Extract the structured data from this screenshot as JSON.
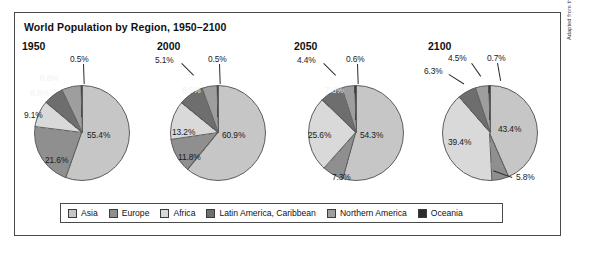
{
  "figure": {
    "title": "World Population by Region, 1950–2100",
    "credit": "Adapted from the United Nations Population Division."
  },
  "legend": {
    "items": [
      {
        "label": "Asia",
        "color": "#c6c6c6"
      },
      {
        "label": "Europe",
        "color": "#8f8f8f"
      },
      {
        "label": "Africa",
        "color": "#d9d9d9"
      },
      {
        "label": "Latin America, Caribbean",
        "color": "#6e6e6e"
      },
      {
        "label": "Northern America",
        "color": "#9e9e9e"
      },
      {
        "label": "Oceania",
        "color": "#2b2b2b"
      }
    ]
  },
  "chart_data": {
    "type": "pie",
    "title": "World Population by Region, 1950–2100",
    "xlabel": "",
    "ylabel": "",
    "legend_position": "bottom",
    "unit": "percent",
    "categories": [
      "Asia",
      "Europe",
      "Africa",
      "Latin America, Caribbean",
      "Northern America",
      "Oceania"
    ],
    "colors": [
      "#c6c6c6",
      "#8f8f8f",
      "#d9d9d9",
      "#6e6e6e",
      "#9e9e9e",
      "#2b2b2b"
    ],
    "panels": [
      {
        "year": "1950",
        "values": [
          55.4,
          21.6,
          9.1,
          6.8,
          6.6,
          0.5
        ],
        "labels": [
          "55.4%",
          "21.6%",
          "9.1%",
          "6.8%",
          "6.6%",
          "0.5%"
        ]
      },
      {
        "year": "2000",
        "values": [
          60.9,
          11.8,
          13.2,
          8.5,
          5.1,
          0.5
        ],
        "labels": [
          "60.9%",
          "11.8%",
          "13.2%",
          "8.5%",
          "5.1%",
          "0.5%"
        ]
      },
      {
        "year": "2050",
        "values": [
          54.3,
          7.3,
          25.6,
          7.8,
          4.4,
          0.6
        ],
        "labels": [
          "54.3%",
          "7.3%",
          "25.6%",
          "7.8%",
          "4.4%",
          "0.6%"
        ]
      },
      {
        "year": "2100",
        "values": [
          43.4,
          5.8,
          39.4,
          6.3,
          4.5,
          0.7
        ],
        "labels": [
          "43.4%",
          "5.8%",
          "39.4%",
          "6.3%",
          "4.5%",
          "0.7%"
        ]
      }
    ]
  },
  "panels": [
    {
      "year": "1950",
      "year_x": 22,
      "year_y": 40,
      "cx": 82,
      "cy": 133,
      "r": 48,
      "labels": [
        {
          "text": "55.4%",
          "x": 87,
          "y": 130,
          "style": "inner-dark"
        },
        {
          "text": "21.6%",
          "x": 45,
          "y": 155,
          "style": "inner-dark"
        },
        {
          "text": "9.1%",
          "x": 24,
          "y": 110,
          "style": "inner-dark"
        },
        {
          "text": "6.8%",
          "x": 30,
          "y": 88,
          "style": "inner-light"
        },
        {
          "text": "6.6%",
          "x": 40,
          "y": 73,
          "style": "inner-light"
        },
        {
          "text": "0.5%",
          "x": 70,
          "y": 54,
          "style": "inner-dark"
        }
      ],
      "leaders": [
        {
          "x": 84,
          "y": 64,
          "len": 20,
          "rot": 88
        }
      ]
    },
    {
      "year": "2000",
      "year_x": 157,
      "year_y": 40,
      "cx": 218,
      "cy": 133,
      "r": 48,
      "labels": [
        {
          "text": "60.9%",
          "x": 222,
          "y": 130,
          "style": "inner-dark"
        },
        {
          "text": "11.8%",
          "x": 178,
          "y": 152,
          "style": "inner-dark"
        },
        {
          "text": "13.2%",
          "x": 172,
          "y": 127,
          "style": "inner-dark"
        },
        {
          "text": "8.5%",
          "x": 182,
          "y": 85,
          "style": "inner-light"
        },
        {
          "text": "5.1%",
          "x": 155,
          "y": 55,
          "style": "inner-dark"
        },
        {
          "text": "0.5%",
          "x": 208,
          "y": 54,
          "style": "inner-dark"
        }
      ],
      "leaders": [
        {
          "x": 182,
          "y": 63,
          "len": 17,
          "rot": 45
        },
        {
          "x": 220,
          "y": 64,
          "len": 20,
          "rot": 88
        }
      ]
    },
    {
      "year": "2050",
      "year_x": 294,
      "year_y": 40,
      "cx": 356,
      "cy": 133,
      "r": 48,
      "labels": [
        {
          "text": "54.3%",
          "x": 360,
          "y": 130,
          "style": "inner-dark"
        },
        {
          "text": "7.3%",
          "x": 332,
          "y": 172,
          "style": "inner-dark"
        },
        {
          "text": "25.6%",
          "x": 308,
          "y": 130,
          "style": "inner-dark"
        },
        {
          "text": "7.8%",
          "x": 325,
          "y": 85,
          "style": "inner-light"
        },
        {
          "text": "4.4%",
          "x": 297,
          "y": 55,
          "style": "inner-dark"
        },
        {
          "text": "0.6%",
          "x": 346,
          "y": 54,
          "style": "inner-dark"
        }
      ],
      "leaders": [
        {
          "x": 324,
          "y": 63,
          "len": 17,
          "rot": 45
        },
        {
          "x": 358,
          "y": 64,
          "len": 20,
          "rot": 88
        }
      ]
    },
    {
      "year": "2100",
      "year_x": 428,
      "year_y": 40,
      "cx": 490,
      "cy": 133,
      "r": 48,
      "labels": [
        {
          "text": "43.4%",
          "x": 498,
          "y": 124,
          "style": "inner-dark"
        },
        {
          "text": "5.8%",
          "x": 516,
          "y": 172,
          "style": "inner-dark"
        },
        {
          "text": "39.4%",
          "x": 448,
          "y": 137,
          "style": "inner-dark"
        },
        {
          "text": "6.3%",
          "x": 424,
          "y": 66,
          "style": "inner-dark"
        },
        {
          "text": "4.5%",
          "x": 448,
          "y": 53,
          "style": "inner-dark"
        },
        {
          "text": "0.7%",
          "x": 487,
          "y": 53,
          "style": "inner-dark"
        }
      ],
      "leaders": [
        {
          "x": 449,
          "y": 74,
          "len": 18,
          "rot": 32
        },
        {
          "x": 472,
          "y": 63,
          "len": 16,
          "rot": 55
        },
        {
          "x": 498,
          "y": 63,
          "len": 18,
          "rot": 80
        },
        {
          "x": 512,
          "y": 178,
          "len": 20,
          "rot": 200
        }
      ]
    }
  ]
}
